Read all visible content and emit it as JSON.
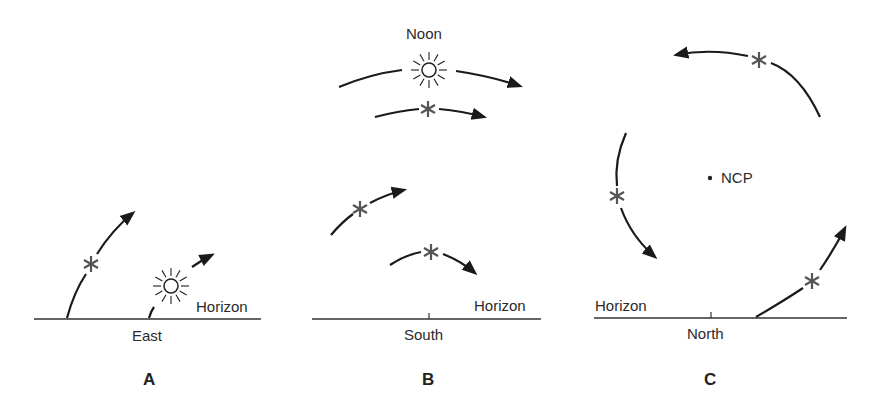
{
  "diagram": {
    "panels": [
      {
        "letter": "A",
        "direction_label": "East",
        "horizon_label": "Horizon",
        "objects": [
          "star-rising",
          "sun-rising"
        ]
      },
      {
        "letter": "B",
        "direction_label": "South",
        "horizon_label": "Horizon",
        "top_label": "Noon",
        "objects": [
          "sun-noon-arc",
          "star-high-arc",
          "star-mid-arc",
          "star-low-arc"
        ]
      },
      {
        "letter": "C",
        "direction_label": "North",
        "horizon_label": "Horizon",
        "center_label": "NCP",
        "objects": [
          "star-top-circumpolar",
          "star-left-circumpolar",
          "star-right-circumpolar"
        ]
      }
    ],
    "colors": {
      "line": "#1a1a1a",
      "star": "#555555",
      "text": "#2a2a2a"
    }
  }
}
